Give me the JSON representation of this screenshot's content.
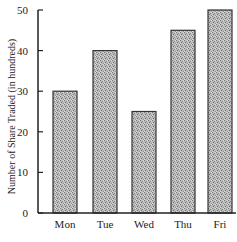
{
  "chart_data": {
    "type": "bar",
    "title": "",
    "xlabel": "",
    "ylabel": "Number of Share Traded (in hundreds)",
    "categories": [
      "Mon",
      "Tue",
      "Wed",
      "Thu",
      "Fri"
    ],
    "values": [
      30,
      40,
      25,
      45,
      50
    ],
    "ylim": [
      0,
      50
    ],
    "yticks": [
      0,
      10,
      20,
      30,
      40,
      50
    ],
    "grid": false,
    "legend": null,
    "bar_fill": "#b0b0b0",
    "bar_stroke": "#333333"
  }
}
